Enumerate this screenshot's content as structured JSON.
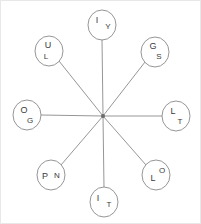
{
  "diagram": {
    "type": "radial-star-diagram",
    "canvas": {
      "width": 201,
      "height": 224
    },
    "border_color": "#e8e8e8",
    "line_color": "#8a8a8a",
    "node_fill": "#ffffff",
    "text_color": "#3a3a3a",
    "hub": {
      "x": 102,
      "y": 115,
      "label": ""
    },
    "node_radius": 14,
    "nodes": [
      {
        "id": "node-top",
        "position": "top",
        "cx": 101,
        "cy": 24,
        "primary": "I",
        "secondary": "Y",
        "primary_x": 96,
        "primary_y": 22,
        "secondary_x": 107,
        "secondary_y": 28
      },
      {
        "id": "node-top-left",
        "position": "top-left",
        "cx": 48,
        "cy": 50,
        "primary": "U",
        "secondary": "L",
        "primary_x": 47,
        "primary_y": 47,
        "secondary_x": 45,
        "secondary_y": 58
      },
      {
        "id": "node-top-right",
        "position": "top-right",
        "cx": 154,
        "cy": 51,
        "primary": "G",
        "secondary": "S",
        "primary_x": 152,
        "primary_y": 48,
        "secondary_x": 158,
        "secondary_y": 58
      },
      {
        "id": "node-left",
        "position": "left",
        "cx": 26,
        "cy": 114,
        "primary": "O",
        "secondary": "G",
        "primary_x": 23,
        "primary_y": 112,
        "secondary_x": 29,
        "secondary_y": 122
      },
      {
        "id": "node-right",
        "position": "right",
        "cx": 175,
        "cy": 115,
        "primary": "L",
        "secondary": "T",
        "primary_x": 172,
        "primary_y": 113,
        "secondary_x": 179,
        "secondary_y": 123
      },
      {
        "id": "node-bottom-left",
        "position": "bottom-left",
        "cx": 50,
        "cy": 174,
        "primary": "P",
        "secondary": "N",
        "primary_x": 44,
        "primary_y": 178,
        "secondary_x": 56,
        "secondary_y": 177
      },
      {
        "id": "node-bottom-right",
        "position": "bottom-right",
        "cx": 155,
        "cy": 174,
        "primary": "L",
        "secondary": "O",
        "primary_x": 152,
        "primary_y": 180,
        "secondary_x": 161,
        "secondary_y": 172
      },
      {
        "id": "node-bottom",
        "position": "bottom",
        "cx": 103,
        "cy": 201,
        "primary": "I",
        "secondary": "T",
        "primary_x": 97,
        "primary_y": 200,
        "secondary_x": 108,
        "secondary_y": 206
      }
    ],
    "spokes": [
      {
        "id": "spoke-top",
        "x1": 102,
        "y1": 115,
        "x2": 101,
        "y2": 38
      },
      {
        "id": "spoke-top-left",
        "x1": 102,
        "y1": 115,
        "x2": 58,
        "y2": 60
      },
      {
        "id": "spoke-top-right",
        "x1": 102,
        "y1": 115,
        "x2": 144,
        "y2": 61
      },
      {
        "id": "spoke-left",
        "x1": 102,
        "y1": 115,
        "x2": 40,
        "y2": 114
      },
      {
        "id": "spoke-right",
        "x1": 102,
        "y1": 115,
        "x2": 161,
        "y2": 115
      },
      {
        "id": "spoke-bottom-left",
        "x1": 102,
        "y1": 115,
        "x2": 60,
        "y2": 164
      },
      {
        "id": "spoke-bottom-right",
        "x1": 102,
        "y1": 115,
        "x2": 145,
        "y2": 164
      },
      {
        "id": "spoke-bottom",
        "x1": 102,
        "y1": 115,
        "x2": 103,
        "y2": 187
      }
    ]
  }
}
